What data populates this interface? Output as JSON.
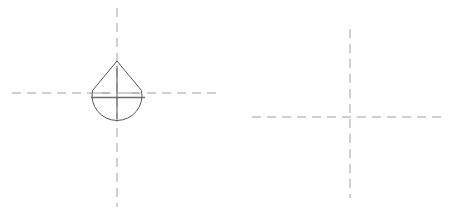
{
  "canvas": {
    "width": 452,
    "height": 214,
    "background": "#ffffff",
    "title": "Technical drawing — drop-shaped profile with centerlines"
  },
  "style": {
    "centerline_color": "#9aa3ad",
    "outline_color": "#555555",
    "chord_color": "#6e6e6e",
    "centerline_width": 1,
    "outline_width": 1,
    "dash_pattern": "9 6",
    "short_dash_pattern": "7 5"
  },
  "figures": [
    {
      "id": "left-figure",
      "name": "drop-shaped-profile-view",
      "center": {
        "x": 117,
        "y": 93
      },
      "centerlines": {
        "horizontal": {
          "x1": 12,
          "y1": 93,
          "x2": 222,
          "y2": 93
        },
        "vertical": {
          "x1": 117,
          "y1": 8,
          "x2": 117,
          "y2": 207
        }
      },
      "outline": {
        "shape": "teardrop",
        "apex": {
          "x": 117,
          "y": 61
        },
        "arc_center": {
          "x": 117,
          "y": 95
        },
        "arc_radius": 25,
        "left_tangent": {
          "x": 93,
          "y": 91
        },
        "right_tangent": {
          "x": 142,
          "y": 91
        },
        "bottom": {
          "x": 117,
          "y": 120
        },
        "path": "M 117 61 L 92.5 90.5 A 25 25 0 1 0 141.5 90.5 Z"
      },
      "chord": {
        "x1": 91,
        "y1": 97.5,
        "x2": 145,
        "y2": 97.5
      },
      "tick_vertical": {
        "x1": 117,
        "y1": 66,
        "x2": 117,
        "y2": 119
      },
      "tick_horizontal_left": {
        "x1": 96,
        "y1": 93,
        "x2": 109,
        "y2": 93
      },
      "tick_horizontal_right": {
        "x1": 126,
        "y1": 93,
        "x2": 139,
        "y2": 93
      }
    },
    {
      "id": "right-figure",
      "name": "crosshair-centerline-mark",
      "center": {
        "x": 350,
        "y": 117
      },
      "centerlines": {
        "horizontal": {
          "x1": 252,
          "y1": 117,
          "x2": 443,
          "y2": 117
        },
        "vertical": {
          "x1": 350,
          "y1": 29,
          "x2": 350,
          "y2": 198
        }
      }
    }
  ]
}
